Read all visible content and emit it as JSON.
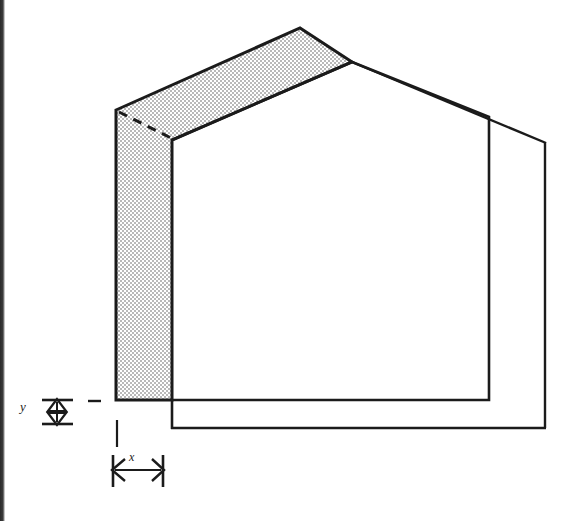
{
  "figure": {
    "type": "line-drawing",
    "background_color": "#ffffff",
    "line_color": "#1b1b1b",
    "shade_fill_color": "#d9d9d9",
    "shade_pattern": "stipple-halftone-dots",
    "scan_edge_color": "#2a2a2a"
  },
  "annotations": {
    "y_label": "y",
    "x_label": "x",
    "y_description": "vertical dimension of shaded band thickness at base",
    "x_description": "horizontal dimension of shaded band width at base"
  },
  "geometry": {
    "units": "pixels",
    "shaded_band": {
      "outer_path": [
        [
          116,
          110
        ],
        [
          300,
          28
        ],
        [
          352,
          62
        ],
        [
          172,
          140
        ],
        [
          172,
          400
        ],
        [
          116,
          400
        ]
      ],
      "eave_dashed_line": {
        "from": [
          118,
          113
        ],
        "to": [
          172,
          140
        ]
      }
    },
    "front_wall": {
      "path": [
        [
          172,
          140
        ],
        [
          352,
          62
        ],
        [
          489,
          117
        ],
        [
          489,
          400
        ],
        [
          172,
          400
        ]
      ]
    },
    "rear_body": {
      "ridge_to_rear": {
        "from": [
          352,
          62
        ],
        "to": [
          545,
          143
        ]
      },
      "rear_right_edge": {
        "from": [
          545,
          143
        ],
        "to": [
          545,
          428
        ]
      },
      "rear_base_line": {
        "from": [
          172,
          428
        ],
        "to": [
          545,
          428
        ]
      },
      "front_left_drop": {
        "from": [
          172,
          400
        ],
        "to": [
          172,
          428
        ]
      }
    },
    "dimension_y": {
      "arrow_axis_x": 57,
      "top_y": 400,
      "bottom_y": 424,
      "tick_left_x": 42,
      "tick_right_x": 72,
      "reference_tick": {
        "from": [
          88,
          401
        ],
        "to": [
          100,
          401
        ]
      }
    },
    "dimension_x": {
      "arrow_axis_y": 470,
      "left_x": 113,
      "right_x": 163,
      "tick_top_y": 456,
      "tick_bottom_y": 486,
      "extension_line": {
        "from": [
          117,
          420
        ],
        "to": [
          117,
          446
        ]
      }
    }
  }
}
